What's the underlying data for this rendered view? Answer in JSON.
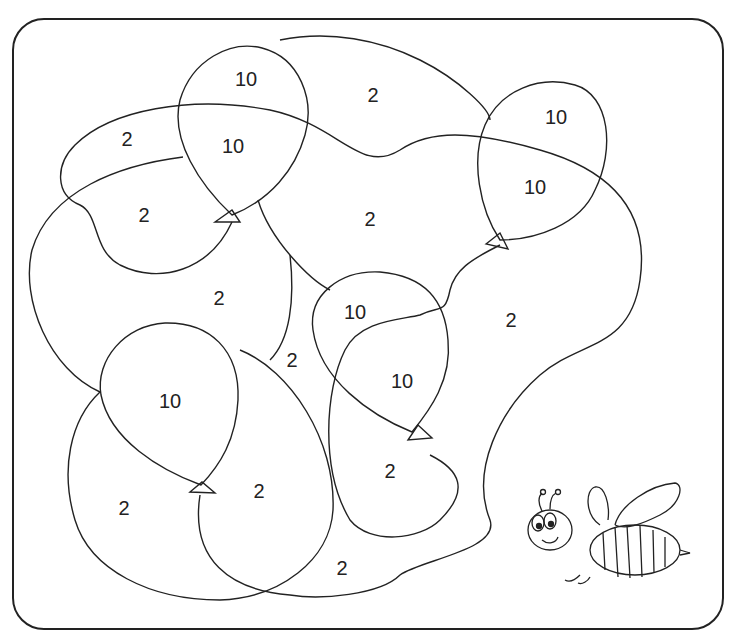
{
  "puzzle": {
    "type": "color-by-number balloon picture",
    "regions": [
      {
        "id": "r1",
        "value": "10",
        "x": 246,
        "y": 79
      },
      {
        "id": "r2",
        "value": "2",
        "x": 373,
        "y": 95
      },
      {
        "id": "r3",
        "value": "10",
        "x": 556,
        "y": 117
      },
      {
        "id": "r4",
        "value": "2",
        "x": 127,
        "y": 139
      },
      {
        "id": "r5",
        "value": "10",
        "x": 233,
        "y": 146
      },
      {
        "id": "r6",
        "value": "10",
        "x": 535,
        "y": 187
      },
      {
        "id": "r7",
        "value": "2",
        "x": 144,
        "y": 215
      },
      {
        "id": "r8",
        "value": "2",
        "x": 370,
        "y": 219
      },
      {
        "id": "r9",
        "value": "2",
        "x": 219,
        "y": 298
      },
      {
        "id": "r10",
        "value": "10",
        "x": 355,
        "y": 312
      },
      {
        "id": "r11",
        "value": "2",
        "x": 511,
        "y": 320
      },
      {
        "id": "r12",
        "value": "2",
        "x": 292,
        "y": 360
      },
      {
        "id": "r13",
        "value": "10",
        "x": 402,
        "y": 381
      },
      {
        "id": "r14",
        "value": "10",
        "x": 170,
        "y": 401
      },
      {
        "id": "r15",
        "value": "2",
        "x": 390,
        "y": 471
      },
      {
        "id": "r16",
        "value": "2",
        "x": 259,
        "y": 491
      },
      {
        "id": "r17",
        "value": "2",
        "x": 124,
        "y": 508
      },
      {
        "id": "r18",
        "value": "2",
        "x": 342,
        "y": 568
      }
    ],
    "illustration": "bee"
  },
  "colors": {
    "line": "#222222",
    "background": "#ffffff"
  }
}
